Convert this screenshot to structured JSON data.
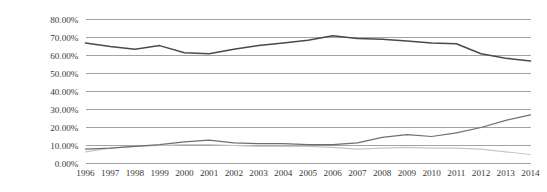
{
  "chart_data": {
    "type": "line",
    "title": "",
    "subtitle": "",
    "xlabel": "",
    "ylabel": "",
    "x": [
      1996,
      1997,
      1998,
      1999,
      2000,
      2001,
      2002,
      2003,
      2004,
      2005,
      2006,
      2007,
      2008,
      2009,
      2010,
      2011,
      2012,
      2013,
      2014
    ],
    "categories": [
      "1996",
      "1997",
      "1998",
      "1999",
      "2000",
      "2001",
      "2002",
      "2003",
      "2004",
      "2005",
      "2006",
      "2007",
      "2008",
      "2009",
      "2010",
      "2011",
      "2012",
      "2013",
      "2014"
    ],
    "ylim": [
      0,
      80
    ],
    "xlim": [
      1996,
      2014
    ],
    "ytick_values": [
      0,
      10,
      20,
      30,
      40,
      50,
      60,
      70,
      80
    ],
    "ytick_labels": [
      "0.00%",
      "10.00%",
      "20.00%",
      "30.00%",
      "40.00%",
      "50.00%",
      "60.00%",
      "70.00%",
      "80.00%"
    ],
    "grid": true,
    "grid_axis": "y",
    "legend": false,
    "legend_position": "none",
    "series": [
      {
        "name": "series-1",
        "color": "#4a4a4a",
        "width": 1.5,
        "values": [
          67.0,
          65.0,
          63.5,
          65.5,
          61.5,
          61.0,
          63.5,
          65.5,
          67.0,
          68.5,
          71.0,
          69.5,
          69.0,
          68.0,
          67.0,
          66.5,
          61.0,
          58.5,
          57.0
        ]
      },
      {
        "name": "series-2",
        "color": "#6e6e6e",
        "width": 1.2,
        "values": [
          8.0,
          8.5,
          9.5,
          10.5,
          12.0,
          13.0,
          11.5,
          11.0,
          11.0,
          10.5,
          10.5,
          11.5,
          14.5,
          16.0,
          15.0,
          17.0,
          20.0,
          24.0,
          27.0
        ]
      },
      {
        "name": "series-3",
        "color": "#c6c6c6",
        "width": 1.2,
        "values": [
          6.5,
          8.5,
          9.5,
          10.0,
          10.5,
          10.5,
          10.0,
          9.5,
          9.5,
          9.5,
          9.0,
          8.0,
          8.5,
          9.0,
          8.5,
          8.5,
          8.0,
          6.5,
          5.0
        ]
      }
    ]
  },
  "axes": {
    "gridline_color": "#999999",
    "text_color": "#3a3a3a"
  }
}
